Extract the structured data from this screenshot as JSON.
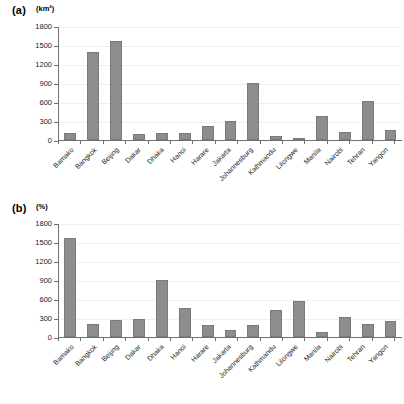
{
  "figure": {
    "panels": [
      {
        "tag": "(a)",
        "unit": "(km²)"
      },
      {
        "tag": "(b)",
        "unit": "(%)"
      }
    ]
  },
  "chart_data": [
    {
      "type": "bar",
      "panel": "(a)",
      "title": "",
      "xlabel": "",
      "ylabel": "(km²)",
      "ylim": [
        0,
        1800
      ],
      "yticks": [
        0,
        300,
        600,
        900,
        1200,
        1500,
        1800
      ],
      "ytick_labels": [
        "0",
        "300",
        "600",
        "900",
        "1200",
        "1500",
        "1800"
      ],
      "grid": true,
      "legend": "none",
      "bar_color": "#8d8d8d",
      "categories": [
        "Bamako",
        "Bangkok",
        "Beijing",
        "Dakar",
        "Dhaka",
        "Hanoi",
        "Harare",
        "Jakarta",
        "Johannesburg",
        "Kathmandu",
        "Lilongwe",
        "Manila",
        "Nairobi",
        "Tehran",
        "Yangon"
      ],
      "values": [
        105,
        1400,
        1570,
        90,
        110,
        110,
        225,
        310,
        915,
        65,
        25,
        390,
        135,
        615,
        165
      ]
    },
    {
      "type": "bar",
      "panel": "(b)",
      "title": "",
      "xlabel": "",
      "ylabel": "(%)",
      "ylim": [
        0,
        1800
      ],
      "yticks": [
        0,
        300,
        600,
        900,
        1200,
        1500,
        1800
      ],
      "ytick_labels": [
        "0",
        "300",
        "600",
        "900",
        "1200",
        "1500",
        "1800"
      ],
      "grid": true,
      "legend": "none",
      "bar_color": "#8d8d8d",
      "categories": [
        "Bamako",
        "Bangkok",
        "Beijing",
        "Dakar",
        "Dhaka",
        "Hanoi",
        "Harare",
        "Jakarta",
        "Johannesburg",
        "Kathmandu",
        "Lilongwe",
        "Manila",
        "Nairobi",
        "Tehran",
        "Yangon"
      ],
      "values": [
        1570,
        205,
        265,
        285,
        910,
        455,
        190,
        110,
        185,
        430,
        580,
        85,
        315,
        200,
        255
      ]
    }
  ]
}
